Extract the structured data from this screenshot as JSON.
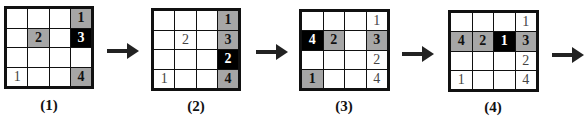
{
  "panels": [
    {
      "label": "(1)",
      "cells": [
        [
          "",
          "",
          "",
          "1"
        ],
        [
          "",
          "2",
          "",
          "3"
        ],
        [
          "",
          "",
          "",
          ""
        ],
        [
          "1",
          "",
          "",
          "4"
        ]
      ],
      "styles": [
        [
          "w",
          "w",
          "w",
          "g"
        ],
        [
          "w",
          "g",
          "w",
          "k"
        ],
        [
          "w",
          "w",
          "w",
          "w"
        ],
        [
          "w",
          "w",
          "w",
          "g"
        ]
      ]
    },
    {
      "label": "(2)",
      "cells": [
        [
          "",
          "",
          "",
          "1"
        ],
        [
          "",
          "2",
          "",
          "3"
        ],
        [
          "",
          "",
          "",
          "2"
        ],
        [
          "1",
          "",
          "",
          "4"
        ]
      ],
      "styles": [
        [
          "w",
          "w",
          "w",
          "g"
        ],
        [
          "w",
          "w",
          "w",
          "g"
        ],
        [
          "w",
          "w",
          "w",
          "k"
        ],
        [
          "w",
          "w",
          "w",
          "g"
        ]
      ]
    },
    {
      "label": "(3)",
      "cells": [
        [
          "",
          "",
          "",
          "1"
        ],
        [
          "4",
          "2",
          "",
          "3"
        ],
        [
          "",
          "",
          "",
          "2"
        ],
        [
          "1",
          "",
          "",
          "4"
        ]
      ],
      "styles": [
        [
          "w",
          "w",
          "w",
          "w"
        ],
        [
          "k",
          "g",
          "w",
          "g"
        ],
        [
          "w",
          "w",
          "w",
          "w"
        ],
        [
          "g",
          "w",
          "w",
          "w"
        ]
      ]
    },
    {
      "label": "(4)",
      "cells": [
        [
          "",
          "",
          "",
          "1"
        ],
        [
          "4",
          "2",
          "1",
          "3"
        ],
        [
          "",
          "",
          "",
          "2"
        ],
        [
          "1",
          "",
          "",
          "4"
        ]
      ],
      "styles": [
        [
          "w",
          "w",
          "w",
          "w"
        ],
        [
          "g",
          "g",
          "k",
          "g"
        ],
        [
          "w",
          "w",
          "w",
          "w"
        ],
        [
          "w",
          "w",
          "w",
          "w"
        ]
      ]
    }
  ],
  "colors": {
    "gray": "#a6a6a6",
    "black": "#000000",
    "white": "#ffffff"
  }
}
